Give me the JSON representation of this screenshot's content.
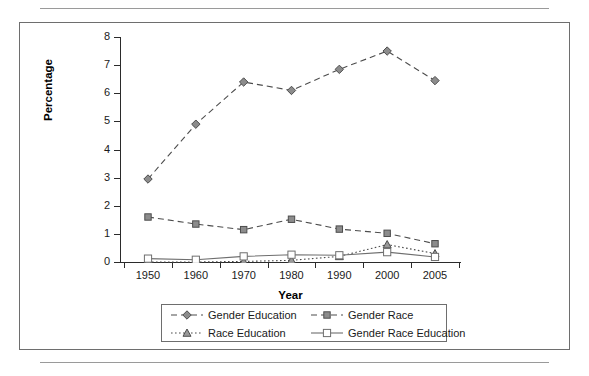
{
  "figure": {
    "panel_border_color": "#6e6e6e",
    "rule_color": "#9a9a9a"
  },
  "chart_data": {
    "type": "line",
    "title": "",
    "xlabel": "Year",
    "ylabel": "Percentage",
    "categories": [
      "1950",
      "1960",
      "1970",
      "1980",
      "1990",
      "2000",
      "2005"
    ],
    "x": [
      1950,
      1960,
      1970,
      1980,
      1990,
      2000,
      2005
    ],
    "ylim": [
      0,
      8
    ],
    "yticks": [
      0,
      1,
      2,
      3,
      4,
      5,
      6,
      7,
      8
    ],
    "ytick_labels": [
      "0",
      "1",
      "2",
      "3",
      "4",
      "5",
      "6",
      "7",
      "8"
    ],
    "grid": false,
    "legend_position": "bottom-outside",
    "series": [
      {
        "name": "Gender Education",
        "marker": "diamond",
        "marker_fill": "#8c8c8c",
        "line_style": "dashed",
        "color": "#4d4d4d",
        "values": [
          2.95,
          4.9,
          6.4,
          6.1,
          6.85,
          7.5,
          6.45
        ]
      },
      {
        "name": "Gender Race",
        "marker": "square-filled",
        "marker_fill": "#8c8c8c",
        "line_style": "dashed",
        "color": "#4d4d4d",
        "values": [
          1.6,
          1.35,
          1.15,
          1.52,
          1.17,
          1.02,
          0.65
        ]
      },
      {
        "name": "Race Education",
        "marker": "triangle",
        "marker_fill": "#9a9a9a",
        "line_style": "dotted",
        "color": "#4d4d4d",
        "values": [
          0.0,
          0.0,
          0.02,
          0.06,
          0.2,
          0.62,
          0.3
        ]
      },
      {
        "name": "Gender Race Education",
        "marker": "square-open",
        "marker_fill": "#ffffff",
        "line_style": "solid",
        "color": "#6e6e6e",
        "values": [
          0.12,
          0.08,
          0.2,
          0.26,
          0.24,
          0.35,
          0.18
        ]
      }
    ]
  },
  "legend": {
    "entries": [
      {
        "label": "Gender Education"
      },
      {
        "label": "Gender Race"
      },
      {
        "label": "Race Education"
      },
      {
        "label": "Gender Race Education"
      }
    ]
  }
}
